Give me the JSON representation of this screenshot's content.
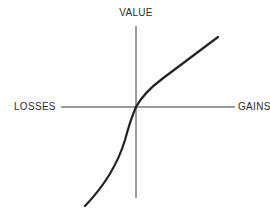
{
  "diagram": {
    "type": "value-function",
    "axes": {
      "vertical_label": "VALUE",
      "horizontal_negative_label": "LOSSES",
      "horizontal_positive_label": "GAINS"
    },
    "curve": {
      "description": "S-shaped value function: concave for gains, convex and steeper for losses, passing through origin"
    },
    "colors": {
      "ink": "#2b2b2b",
      "background": "#ffffff"
    }
  }
}
